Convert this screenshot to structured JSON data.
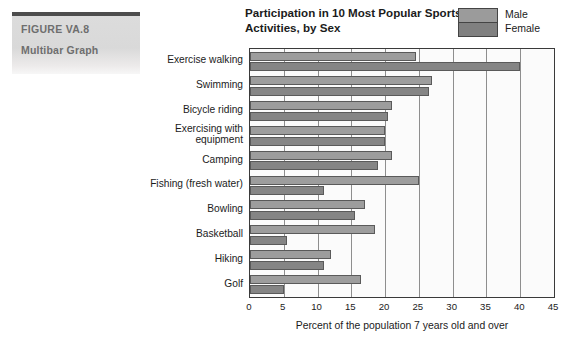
{
  "figure": {
    "number": "FIGURE VA.8",
    "caption": "Multibar Graph"
  },
  "legend": {
    "male_label": "Male",
    "female_label": "Female",
    "male_color": "#9d9d9d",
    "female_color": "#858585"
  },
  "chart_data": {
    "type": "bar",
    "orientation": "horizontal",
    "title": "Participation in 10 Most Popular Sports Activities, by Sex",
    "xlabel": "Percent of the population 7 years old and over",
    "ylabel": "",
    "xlim": [
      0,
      45
    ],
    "xticks": [
      0,
      5,
      10,
      15,
      20,
      25,
      30,
      35,
      40,
      45
    ],
    "grid": true,
    "legend_position": "top-right",
    "categories": [
      "Exercise walking",
      "Swimming",
      "Bicycle riding",
      "Exercising with equipment",
      "Camping",
      "Fishing (fresh water)",
      "Bowling",
      "Basketball",
      "Hiking",
      "Golf"
    ],
    "series": [
      {
        "name": "Male",
        "values": [
          24.5,
          27.0,
          21.0,
          20.0,
          21.0,
          25.0,
          17.0,
          18.5,
          12.0,
          16.5
        ]
      },
      {
        "name": "Female",
        "values": [
          40.0,
          26.5,
          20.5,
          20.0,
          19.0,
          11.0,
          15.5,
          5.5,
          11.0,
          5.0
        ]
      }
    ]
  }
}
